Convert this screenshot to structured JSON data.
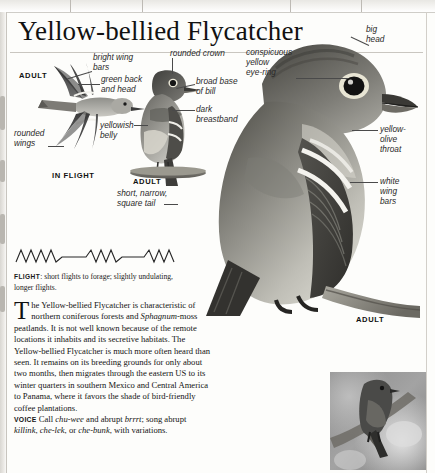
{
  "page": {
    "title": "Yellow-bellied Flycatcher"
  },
  "annotations": {
    "bright_wing_bars": "bright wing\nbars",
    "green_back_head": "green back\nand head",
    "rounded_crown": "rounded crown",
    "broad_base_bill": "broad base\nof bill",
    "dark_breastband": "dark\nbreastband",
    "conspicuous_eyering": "conspicuous\nyellow\neye-ring",
    "big_head": "big\nhead",
    "yellow_olive_throat": "yellow-\nolive\nthroat",
    "white_wing_bars": "white\nwing\nbars",
    "yellowish_belly": "yellowish\nbelly",
    "rounded_wings": "rounded\nwings",
    "short_narrow_square_tail": "short, narrow,\nsquare tail"
  },
  "captions": {
    "adult_flight": "ADULT",
    "in_flight": "IN FLIGHT",
    "adult_perched": "ADULT",
    "adult_main": "ADULT"
  },
  "flight": {
    "keyword": "FLIGHT",
    "text": ": short flights to forage; slightly undulating, longer flights."
  },
  "body": {
    "dropcap": "T",
    "para_1a": "he Yellow-bellied Flycatcher is characteristic of northern coniferous forests and ",
    "para_1_italic": "Sphagnum",
    "para_1b": "-moss peatlands. It is not well known because of the remote locations it inhabits and its secretive habitats. The Yellow-bellied Flycatcher is much more often heard than seen. It remains on its breeding grounds for only about two months, then migrates through the eastern US to its winter quarters in southern Mexico and Central America to Panama, where it favors the shade of bird-friendly coffee plantations.",
    "voice_keyword": "VOICE",
    "voice_1": " Call ",
    "voice_call_1": "chu-wee",
    "voice_2": " and abrupt ",
    "voice_call_2": "brrrt",
    "voice_3": "; song abrupt ",
    "voice_call_3": "killink",
    "voice_4": ", ",
    "voice_call_4": "che-lek",
    "voice_5": ", or ",
    "voice_call_5": "che-bunk",
    "voice_6": ", with variations."
  },
  "colors": {
    "page_background": "#fdfdfb",
    "text": "#141414",
    "leader_line": "#4a4a4a",
    "rule": "#c9c6c0",
    "scan_edge": "#d9d7d2"
  }
}
